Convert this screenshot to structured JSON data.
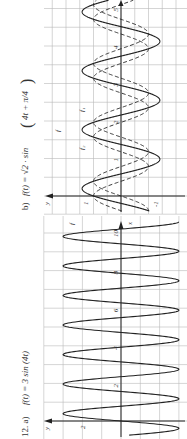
{
  "figure": {
    "problem_number": "12.",
    "rotation": "90deg counter-clockwise"
  },
  "chart_data": [
    {
      "type": "line",
      "panel": "a)",
      "title": "f(t) = 3 sin (4t)",
      "xlabel": "x",
      "ylabel": "y",
      "x_ticks": [
        2,
        4,
        6,
        8,
        10
      ],
      "y_ticks": [
        2
      ],
      "xlim": [
        -0.7,
        10.6
      ],
      "ylim": [
        -3.2,
        3.4
      ],
      "grid": true,
      "series": [
        {
          "name": "f",
          "function": "3*sin(4t)",
          "style": "solid",
          "amplitude": 3,
          "period": 1.5708
        }
      ],
      "annotations": [
        "f"
      ]
    },
    {
      "type": "line",
      "panel": "b)",
      "title": "f(t) = √2 · sin(4t + π/4)",
      "xlabel": "x",
      "ylabel": "y",
      "x_ticks": [
        1,
        2,
        3,
        4,
        5
      ],
      "x_tick_labels": [
        "1",
        "2",
        "3",
        "4",
        "5"
      ],
      "y_ticks": [
        1,
        -1
      ],
      "grid": true,
      "series": [
        {
          "name": "f",
          "function": "sqrt(2)*sin(4t+pi/4)",
          "style": "solid",
          "amplitude": 1.414
        },
        {
          "name": "f1",
          "function": "sin(4t)",
          "style": "dashed",
          "amplitude": 1
        },
        {
          "name": "f2",
          "function": "cos(4t)",
          "style": "dashed",
          "amplitude": 1
        }
      ],
      "annotations": [
        "f",
        "f1",
        "f2"
      ]
    }
  ],
  "labels": {
    "a_title_prefix": "12.  a)",
    "a_title": "f(t) = 3 sin (4t)",
    "b_title_prefix": "b)",
    "b_title_main": "f(t) = √2 · sin",
    "b_title_paren": "4t + π/4",
    "y_axis": "y",
    "x_axis": "x",
    "a_ytick": "2",
    "a_xticks": [
      "2",
      "4",
      "6",
      "8",
      "10"
    ],
    "a_curve": "f",
    "b_ytick_pos": "1",
    "b_ytick_neg": "-1",
    "b_xticks": [
      "1",
      "2",
      "3",
      "4",
      "5"
    ],
    "b_f": "f",
    "b_f1": "f₁",
    "b_f2": "f₂"
  }
}
